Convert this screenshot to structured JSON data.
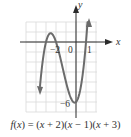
{
  "chart_data": {
    "type": "line",
    "title": "",
    "function_label": "f(x) = (x + 2)(x − 1)(x + 3)",
    "xlabel": "x",
    "ylabel": "y",
    "x_ticks_labeled": [
      {
        "value": -2,
        "label": "−2"
      },
      {
        "value": 0,
        "label": "0"
      },
      {
        "value": 1,
        "label": "1"
      }
    ],
    "y_ticks_labeled": [
      {
        "value": -6,
        "label": "−6"
      }
    ],
    "grid": true,
    "xlim": [
      -5,
      2
    ],
    "ylim": [
      -7,
      2
    ],
    "zeros": [
      -3,
      -2,
      1
    ],
    "y_intercept": -6,
    "series": [
      {
        "name": "f(x)",
        "x": [
          -3.6,
          -3.4,
          -3.2,
          -3.0,
          -2.8,
          -2.6,
          -2.4,
          -2.2,
          -2.0,
          -1.8,
          -1.6,
          -1.4,
          -1.2,
          -1.0,
          -0.8,
          -0.6,
          -0.4,
          -0.2,
          0.0,
          0.2,
          0.4,
          0.6,
          0.8,
          1.0,
          1.2
        ],
        "y": [
          -4.42,
          -2.46,
          -1.01,
          0.0,
          0.61,
          0.86,
          0.82,
          0.51,
          0.0,
          -0.67,
          -1.45,
          -2.3,
          -3.17,
          -4.0,
          -4.75,
          -5.38,
          -5.82,
          -6.05,
          -6.0,
          -5.63,
          -4.91,
          -3.74,
          -2.12,
          0.0,
          2.69
        ]
      }
    ],
    "arrows": [
      "left-end-down",
      "right-end-up"
    ]
  },
  "labels": {
    "x_axis": "x",
    "y_axis": "y",
    "tick_neg2": "−2",
    "tick_0": "0",
    "tick_1": "1",
    "tick_neg6": "−6"
  },
  "caption": {
    "f": "f",
    "lp1": "(",
    "x1": "x",
    "rest1": ") = (",
    "x2": "x",
    "rest2": " + 2)(",
    "x3": "x",
    "rest3": " − 1)(",
    "x4": "x",
    "rest4": " + 3)"
  },
  "colors": {
    "curve": "#6b6b6b",
    "axes": "#2b2b2b",
    "grid": "#d9d9d9"
  }
}
